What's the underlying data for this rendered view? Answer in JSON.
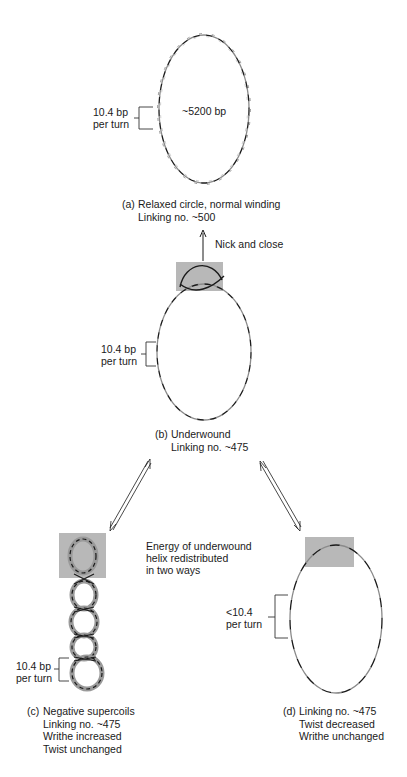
{
  "figure": {
    "panels": {
      "a": {
        "tag": "(a)",
        "caption": [
          "Relaxed circle, normal winding",
          "Linking no. ~500"
        ],
        "size_label": "~5200 bp",
        "turn_label": [
          "10.4 bp",
          "per turn"
        ]
      },
      "transition_ab": {
        "label": "Nick and close"
      },
      "b": {
        "tag": "(b)",
        "caption": [
          "Underwound",
          "Linking no. ~475"
        ],
        "turn_label": [
          "10.4 bp",
          "per turn"
        ]
      },
      "energy_note": [
        "Energy of underwound",
        "helix redistributed",
        "in two ways"
      ],
      "c": {
        "tag": "(c)",
        "caption": [
          "Negative supercoils",
          "Linking no. ~475",
          "Writhe increased",
          "Twist unchanged"
        ],
        "turn_label": [
          "10.4 bp",
          "per turn"
        ]
      },
      "d": {
        "tag": "(d)",
        "caption": [
          "Linking no. ~475",
          "Twist decreased",
          "Writhe unchanged"
        ],
        "turn_label": [
          "<10.4",
          "per turn"
        ]
      }
    },
    "colors": {
      "strand_dark": "#1a1a1a",
      "strand_light": "#8a8a8a",
      "highlight_box": "#b8b8b8",
      "text": "#1a1a1a"
    }
  }
}
